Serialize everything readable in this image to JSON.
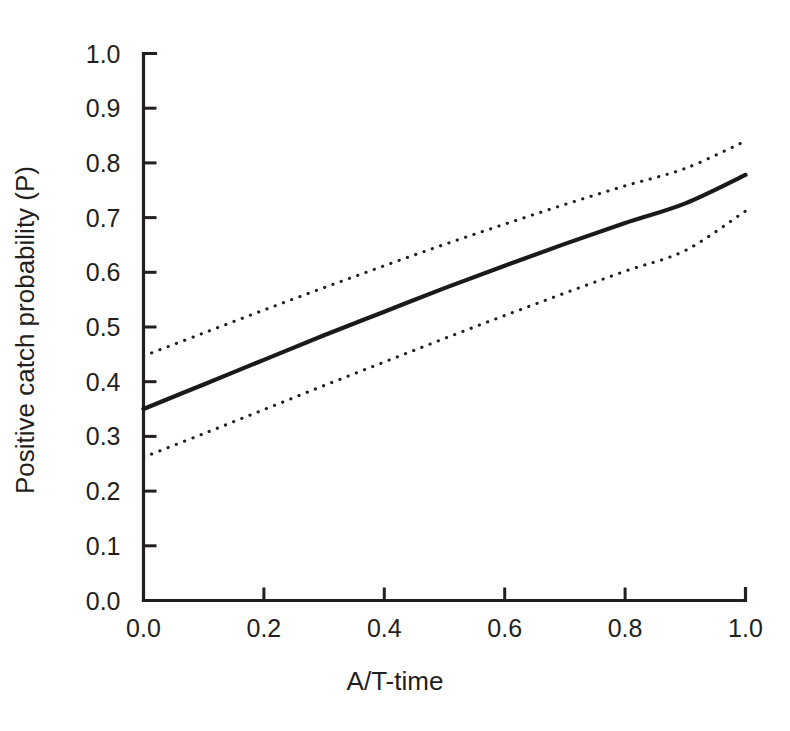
{
  "chart_data": {
    "type": "line",
    "title": "",
    "xlabel": "A/T-time",
    "ylabel": "Positive catch probability (P)",
    "xlim": [
      0.0,
      1.0
    ],
    "ylim": [
      0.0,
      1.0
    ],
    "xticks": [
      "0.0",
      "0.2",
      "0.4",
      "0.6",
      "0.8",
      "1.0"
    ],
    "xtick_values": [
      0.0,
      0.2,
      0.4,
      0.6,
      0.8,
      1.0
    ],
    "yticks": [
      "0.0",
      "0.1",
      "0.2",
      "0.3",
      "0.4",
      "0.5",
      "0.6",
      "0.7",
      "0.8",
      "0.9",
      "1.0"
    ],
    "ytick_values": [
      0.0,
      0.1,
      0.2,
      0.3,
      0.4,
      0.5,
      0.6,
      0.7,
      0.8,
      0.9,
      1.0
    ],
    "grid": false,
    "legend": "none",
    "x": [
      0.0,
      0.1,
      0.2,
      0.3,
      0.4,
      0.5,
      0.6,
      0.7,
      0.8,
      0.9,
      1.0
    ],
    "series": [
      {
        "name": "Fitted positive catch probability",
        "style": "solid",
        "color": "#1a1a1a",
        "values": [
          0.35,
          0.395,
          0.44,
          0.485,
          0.528,
          0.571,
          0.612,
          0.652,
          0.69,
          0.726,
          0.778
        ]
      },
      {
        "name": "Upper 95% confidence limit",
        "style": "dotted",
        "color": "#231f20",
        "values": [
          0.447,
          0.489,
          0.531,
          0.572,
          0.612,
          0.651,
          0.688,
          0.724,
          0.758,
          0.79,
          0.84
        ]
      },
      {
        "name": "Lower 95% confidence limit",
        "style": "dotted",
        "color": "#231f20",
        "values": [
          0.262,
          0.305,
          0.349,
          0.393,
          0.436,
          0.479,
          0.521,
          0.562,
          0.602,
          0.64,
          0.712
        ]
      }
    ]
  },
  "axes": {
    "x_title": "A/T-time",
    "y_title": "Positive catch probability (P)"
  }
}
